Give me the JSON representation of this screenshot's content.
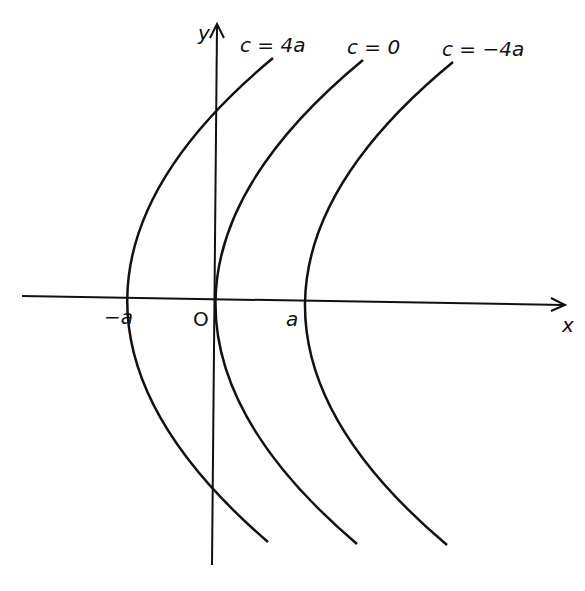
{
  "figure": {
    "axes": {
      "x_label": "x",
      "y_label": "y",
      "origin_label": "O",
      "tick_labels": [
        {
          "id": "neg-a",
          "text": "−a",
          "x": 104,
          "y": 324
        },
        {
          "id": "pos-a",
          "text": "a",
          "x": 286,
          "y": 326
        }
      ]
    },
    "curves": [
      {
        "id": "c-4a",
        "label": "c = 4a",
        "label_x": 240,
        "label_y": 52,
        "vertex_x": 128,
        "vertex_y": 298
      },
      {
        "id": "c-0",
        "label": "c = 0",
        "label_x": 347,
        "label_y": 54,
        "vertex_x": 217,
        "vertex_y": 301
      },
      {
        "id": "c-neg4a",
        "label": "c = −4a",
        "label_x": 442,
        "label_y": 56,
        "vertex_x": 305,
        "vertex_y": 303
      }
    ],
    "colors": {
      "stroke": "#111111",
      "background": "#ffffff"
    }
  }
}
